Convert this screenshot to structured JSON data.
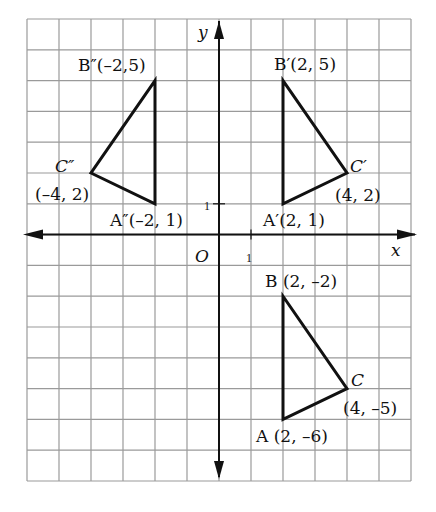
{
  "chart_data": {
    "type": "diagram",
    "title": "",
    "grid": {
      "xmin": -6,
      "xmax": 6,
      "ymin": -8,
      "ymax": 7,
      "step": 1,
      "grid_on": true
    },
    "axes": {
      "xlabel": "x",
      "ylabel": "y",
      "origin_label": "O",
      "x_tick_label": "1",
      "y_tick_label": "1"
    },
    "triangles": [
      {
        "name": "ABC",
        "vertices": [
          {
            "id": "A",
            "label": "A",
            "coord": "(2, –6)",
            "x": 2,
            "y": -6
          },
          {
            "id": "B",
            "label": "B",
            "coord": "(2, –2)",
            "x": 2,
            "y": -2
          },
          {
            "id": "C",
            "label": "C",
            "coord": "(4, –5)",
            "x": 4,
            "y": -5
          }
        ]
      },
      {
        "name": "A'B'C'",
        "vertices": [
          {
            "id": "A1",
            "label": "A′",
            "coord": "(2, 1)",
            "x": 2,
            "y": 1
          },
          {
            "id": "B1",
            "label": "B′",
            "coord": "(2, 5)",
            "x": 2,
            "y": 5
          },
          {
            "id": "C1",
            "label": "C′",
            "coord": "(4, 2)",
            "x": 4,
            "y": 2
          }
        ]
      },
      {
        "name": "A''B''C''",
        "vertices": [
          {
            "id": "A2",
            "label": "A″",
            "coord": "(–2, 1)",
            "x": -2,
            "y": 1
          },
          {
            "id": "B2",
            "label": "B″",
            "coord": "(–2,5)",
            "x": -2,
            "y": 5
          },
          {
            "id": "C2",
            "label": "C″",
            "coord": "(–4, 2)",
            "x": -4,
            "y": 2
          }
        ]
      }
    ]
  },
  "labels": {
    "B": "B (2, –2)",
    "C_name": "C",
    "C_coord": "(4, –5)",
    "A": "A (2, –6)",
    "B1": "B′(2, 5)",
    "C1_name": "C′",
    "C1_coord": "(4, 2)",
    "A1": "A′(2, 1)",
    "B2": "B″(–2,5)",
    "C2_name": "C″",
    "C2_coord": "(–4, 2)",
    "A2": "A″(–2, 1)"
  },
  "colors": {
    "grid": "#9a9a9a",
    "axis": "#111111",
    "shape": "#111111"
  }
}
